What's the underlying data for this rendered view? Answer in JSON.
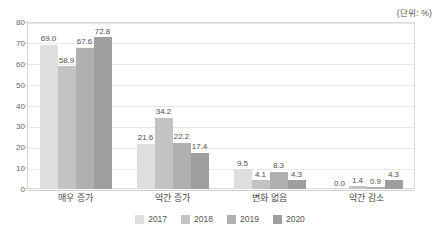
{
  "unit_note": "(단위: %)",
  "chart_data": {
    "type": "bar",
    "title": "",
    "subtitle": "",
    "xlabel": "",
    "ylabel": "",
    "unit": "(단위: %)",
    "ylim": [
      0,
      80
    ],
    "yticks": [
      0,
      10,
      20,
      30,
      40,
      50,
      60,
      70,
      80
    ],
    "ytick_labels": [
      "0",
      "10",
      "20",
      "30",
      "40",
      "50",
      "60",
      "70",
      "80"
    ],
    "grid": true,
    "legend_position": "bottom",
    "categories": [
      "매우 증가",
      "약간 증가",
      "변화 없음",
      "약간 감소"
    ],
    "series": [
      {
        "name": "2017",
        "color": "#dedede",
        "values": [
          69.0,
          21.6,
          9.5,
          0.0
        ],
        "labels": [
          "69.0",
          "21.6",
          "9.5",
          "0.0"
        ]
      },
      {
        "name": "2018",
        "color": "#c3c3c3",
        "values": [
          58.9,
          34.2,
          4.1,
          1.4
        ],
        "labels": [
          "58.9",
          "34.2",
          "4.1",
          "1.4"
        ]
      },
      {
        "name": "2019",
        "color": "#b0b0b0",
        "values": [
          67.6,
          22.2,
          8.3,
          0.9
        ],
        "labels": [
          "67.6",
          "22.2",
          "8.3",
          "0.9"
        ]
      },
      {
        "name": "2020",
        "color": "#9e9e9e",
        "values": [
          72.8,
          17.4,
          4.3,
          4.3
        ],
        "labels": [
          "72.8",
          "17.4",
          "4.3",
          "4.3"
        ]
      }
    ]
  }
}
